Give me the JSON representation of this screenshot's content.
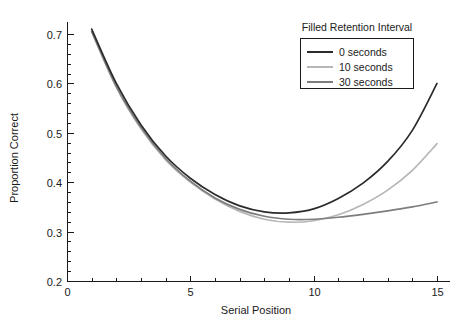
{
  "chart_data": {
    "type": "line",
    "title": "",
    "xlabel": "Serial Position",
    "ylabel": "Proportion Correct",
    "xlim": [
      0,
      16
    ],
    "ylim": [
      0.2,
      0.72
    ],
    "xticks": [
      0,
      5,
      10,
      15
    ],
    "xtick_labels": [
      "0",
      "5",
      "10",
      "15"
    ],
    "yticks": [
      0.2,
      0.3,
      0.4,
      0.5,
      0.6,
      0.7
    ],
    "ytick_labels": [
      "0.2",
      "0.3",
      "0.4",
      "0.5",
      "0.6",
      "0.7"
    ],
    "x_minor_tick_step": 1,
    "y_minor_tick_step": 0.02,
    "grid": false,
    "legend_title": "Filled Retention Interval",
    "legend_position": "top-right",
    "x": [
      1,
      2,
      3,
      4,
      5,
      6,
      7,
      8,
      9,
      10,
      11,
      12,
      13,
      14,
      15
    ],
    "series": [
      {
        "name": "0 seconds",
        "color": "#2b2b2b",
        "width": 1.7,
        "values": [
          0.71,
          0.6,
          0.516,
          0.453,
          0.408,
          0.375,
          0.352,
          0.34,
          0.338,
          0.346,
          0.367,
          0.398,
          0.442,
          0.505,
          0.6
        ]
      },
      {
        "name": "10 seconds",
        "color": "#b6b6b6",
        "width": 1.7,
        "values": [
          0.705,
          0.592,
          0.508,
          0.445,
          0.4,
          0.366,
          0.341,
          0.325,
          0.319,
          0.322,
          0.334,
          0.355,
          0.384,
          0.424,
          0.478
        ]
      },
      {
        "name": "30 seconds",
        "color": "#7d7d7d",
        "width": 1.7,
        "values": [
          0.705,
          0.594,
          0.511,
          0.448,
          0.402,
          0.368,
          0.345,
          0.331,
          0.325,
          0.325,
          0.329,
          0.335,
          0.342,
          0.35,
          0.36
        ]
      }
    ]
  },
  "axes": {
    "x_axis_label": "Serial Position",
    "y_axis_label": "Proportion Correct"
  },
  "legend": {
    "title": "Filled Retention Interval",
    "entries": [
      {
        "label": "0 seconds"
      },
      {
        "label": "10 seconds"
      },
      {
        "label": "30 seconds"
      }
    ]
  }
}
